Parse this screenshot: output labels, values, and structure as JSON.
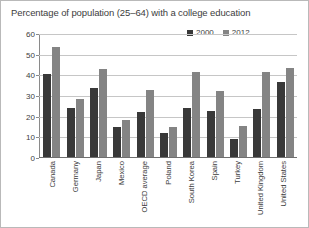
{
  "chart_data": {
    "type": "bar",
    "title": "Percentage of population (25–64) with a college education",
    "xlabel": "",
    "ylabel": "",
    "ylim": [
      0,
      60
    ],
    "yticks": [
      0,
      10,
      20,
      30,
      40,
      50,
      60
    ],
    "grid": true,
    "legend_position": "top-right",
    "categories": [
      "Canada",
      "Germany",
      "Japan",
      "Mexico",
      "OECD average",
      "Poland",
      "South Korea",
      "Spain",
      "Turkey",
      "United Kingdom",
      "United States"
    ],
    "series": [
      {
        "name": "2000",
        "color": "#393939",
        "values": [
          40,
          23.5,
          33.5,
          14.5,
          22,
          11.5,
          23.5,
          22.5,
          8.5,
          23,
          36.5
        ]
      },
      {
        "name": "2012",
        "color": "#848484",
        "values": [
          53,
          28,
          42.5,
          18,
          32.5,
          14.5,
          41,
          32,
          15,
          41,
          43
        ]
      }
    ]
  },
  "legend": {
    "entries": [
      {
        "label": "2000",
        "color": "#393939"
      },
      {
        "label": "2012",
        "color": "#848484"
      }
    ]
  }
}
